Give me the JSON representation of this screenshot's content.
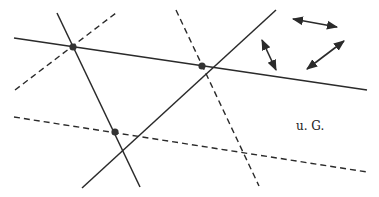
{
  "diagram": {
    "stroke_color": "#2a2a2a",
    "label": {
      "text": "u. G.",
      "x": 296,
      "y": 119
    },
    "solid_lines": [
      {
        "name": "solid-line-horizontal",
        "x1": 14,
        "y1": 38,
        "x2": 367,
        "y2": 90
      },
      {
        "name": "solid-line-steep",
        "x1": 57,
        "y1": 13,
        "x2": 140,
        "y2": 187
      },
      {
        "name": "solid-line-rising",
        "x1": 82,
        "y1": 188,
        "x2": 276,
        "y2": 10
      }
    ],
    "dashed_lines": [
      {
        "name": "dashed-line-rising",
        "x1": 15,
        "y1": 90,
        "x2": 116,
        "y2": 13
      },
      {
        "name": "dashed-line-steep",
        "x1": 176,
        "y1": 10,
        "x2": 259,
        "y2": 186
      },
      {
        "name": "dashed-line-horizontal",
        "x1": 14,
        "y1": 117,
        "x2": 367,
        "y2": 172
      }
    ],
    "points": [
      {
        "name": "intersection-point-1",
        "cx": 73,
        "cy": 47
      },
      {
        "name": "intersection-point-2",
        "cx": 202,
        "cy": 66
      },
      {
        "name": "intersection-point-3",
        "cx": 115,
        "cy": 132
      }
    ],
    "arrows": [
      {
        "name": "double-arrow-horizontal",
        "x1": 293,
        "y1": 19,
        "x2": 337,
        "y2": 27
      },
      {
        "name": "double-arrow-steep",
        "x1": 262,
        "y1": 40,
        "x2": 276,
        "y2": 70
      },
      {
        "name": "double-arrow-diagonal",
        "x1": 307,
        "y1": 69,
        "x2": 344,
        "y2": 41
      }
    ]
  }
}
